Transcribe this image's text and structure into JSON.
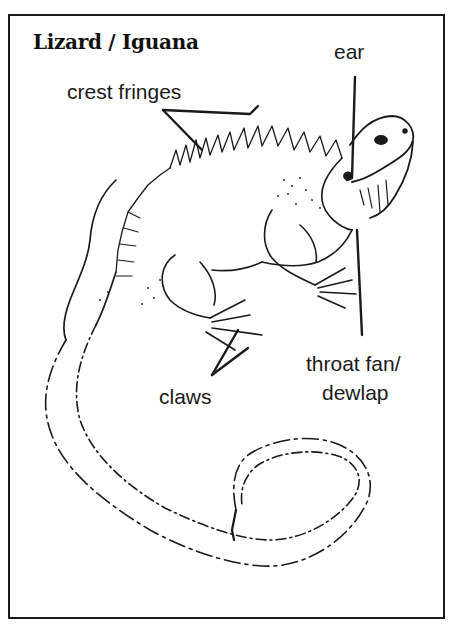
{
  "title": "Lizard / Iguana",
  "labels": {
    "crest": "crest fringes",
    "ear": "ear",
    "claws": "claws",
    "throat_line1": "throat fan/",
    "throat_line2": "dewlap"
  },
  "colors": {
    "ink": "#1a1a1a",
    "background": "#ffffff"
  }
}
